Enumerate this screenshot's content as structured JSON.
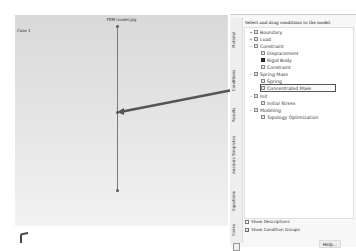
{
  "viewport": {
    "title": "FEM model.jpg",
    "case_label": "Case 1"
  },
  "panel": {
    "instruction": "Select and drag conditions to the model.",
    "side_tabs": [
      "Material",
      "Conditions",
      "Results",
      "Analysis Templates",
      "Equations",
      "Forms"
    ],
    "tree": [
      {
        "label": "Boundary",
        "level": 0,
        "expand": "+",
        "icon": "folder"
      },
      {
        "label": "Load",
        "level": 0,
        "expand": "+",
        "icon": "folder"
      },
      {
        "label": "Constraint",
        "level": 0,
        "expand": "−",
        "icon": "folder"
      },
      {
        "label": "Displacement",
        "level": 1,
        "expand": "",
        "icon": "item"
      },
      {
        "label": "Rigid Body",
        "level": 1,
        "expand": "",
        "icon": "item-dark"
      },
      {
        "label": "Constraint",
        "level": 1,
        "expand": "",
        "icon": "item"
      },
      {
        "label": "Spring Mass",
        "level": 0,
        "expand": "−",
        "icon": "folder"
      },
      {
        "label": "Spring",
        "level": 1,
        "expand": "",
        "icon": "item"
      },
      {
        "label": "Concentrated Mass",
        "level": 1,
        "expand": "",
        "icon": "item",
        "selected": true
      },
      {
        "label": "Init",
        "level": 0,
        "expand": "−",
        "icon": "folder"
      },
      {
        "label": "Initial Stress",
        "level": 1,
        "expand": "",
        "icon": "item"
      },
      {
        "label": "Modeling",
        "level": 0,
        "expand": "−",
        "icon": "folder"
      },
      {
        "label": "Topology Optimization",
        "level": 1,
        "expand": "",
        "icon": "item"
      }
    ],
    "checkboxes": [
      {
        "label": "Show Descriptions",
        "checked": false
      },
      {
        "label": "Show Condition Groups",
        "checked": true
      }
    ],
    "help_label": "Help..."
  },
  "colors": {
    "viewport_bg": "#dedede",
    "drag_arrow": "#555555"
  }
}
